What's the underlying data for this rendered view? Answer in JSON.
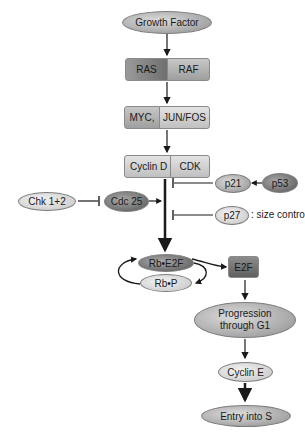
{
  "nodes": {
    "growth_factor": "Growth Factor",
    "ras": "RAS",
    "raf": "RAF",
    "myc": "MYC,",
    "jun_fos": "JUN/FOS",
    "cyclin_d": "Cyclin D",
    "cdk": "CDK",
    "chk": "Chk 1+2",
    "cdc25": "Cdc 25",
    "p21": "p21",
    "p53": "p53",
    "p27": "p27",
    "size_control": ": size control",
    "rb_e2f": "Rb•E2F",
    "rb_p": "Rb•P",
    "e2f": "E2F",
    "progression_line1": "Progression",
    "progression_line2": "through G1",
    "cyclin_e": "Cyclin E",
    "entry_s": "Entry into S"
  },
  "colors": {
    "line": "#1a1a1a",
    "dark_node": "#6e6e6e",
    "light_node": "#cfcfcf"
  }
}
